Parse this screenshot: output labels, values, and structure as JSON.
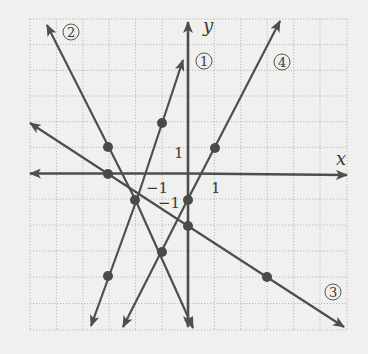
{
  "diagram": {
    "type": "coordinate-plane",
    "axes": {
      "x_label": "x",
      "y_label": "y",
      "tick_labels": {
        "x_pos": "1",
        "x_neg": "−1",
        "y_pos": "1",
        "y_neg": "−1"
      },
      "range": {
        "x": [
          -6,
          6
        ],
        "y": [
          -6,
          6
        ]
      }
    },
    "lines": [
      {
        "id": "1",
        "label": "1",
        "equation": "y = 3x + 5",
        "points": [
          [
            -3,
            -4
          ],
          [
            -2,
            -1
          ],
          [
            -1,
            2
          ]
        ]
      },
      {
        "id": "2",
        "label": "2",
        "equation": "y = -2x - 5",
        "points": [
          [
            -3,
            1
          ],
          [
            -2,
            -1
          ],
          [
            -1,
            -3
          ]
        ]
      },
      {
        "id": "3",
        "label": "3",
        "equation": "y = -2/3x - 2",
        "points": [
          [
            -3,
            0
          ],
          [
            0,
            -2
          ],
          [
            3,
            -4
          ]
        ]
      },
      {
        "id": "4",
        "label": "4",
        "equation": "y = 2x - 1",
        "points": [
          [
            -1,
            -3
          ],
          [
            0,
            -1
          ],
          [
            1,
            1
          ]
        ]
      }
    ],
    "colors": {
      "background": "#f0f0ee",
      "line": "#4e4e4e",
      "grid": "#b8b8b8"
    }
  }
}
